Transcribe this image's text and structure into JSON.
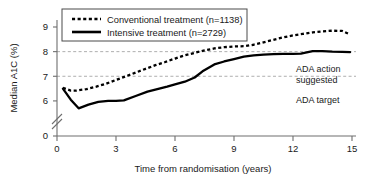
{
  "chart_data": {
    "type": "line",
    "title": "",
    "xlabel": "Time from randomisation (years)",
    "ylabel": "Median A1C (%)",
    "xlim": [
      0,
      15
    ],
    "ylim": [
      5.4,
      9.1
    ],
    "xticks": [
      "0",
      "3",
      "6",
      "9",
      "12",
      "15"
    ],
    "xtick_values": [
      0,
      3,
      6,
      9,
      12,
      15
    ],
    "yticks": [
      "0",
      "6",
      "7",
      "8",
      "9"
    ],
    "ytick_values": [
      0,
      6,
      7,
      8,
      9
    ],
    "y_axis_break": true,
    "grid": false,
    "legend_position": "top-center",
    "series": [
      {
        "name": "Conventional treatment (n=1138)",
        "style": "dotted",
        "color": "#000000",
        "x": [
          0.3,
          0.7,
          1.0,
          1.5,
          2.0,
          2.5,
          3.0,
          3.5,
          4.0,
          4.5,
          5.0,
          5.5,
          6.0,
          6.5,
          7.0,
          7.5,
          8.0,
          8.5,
          9.0,
          9.5,
          10.0,
          10.5,
          11.0,
          11.5,
          12.0,
          12.5,
          13.0,
          13.5,
          14.0,
          14.5,
          14.9
        ],
        "values": [
          6.53,
          6.42,
          6.42,
          6.48,
          6.58,
          6.7,
          6.85,
          7.0,
          7.15,
          7.3,
          7.45,
          7.58,
          7.72,
          7.85,
          7.95,
          8.05,
          8.13,
          8.18,
          8.21,
          8.22,
          8.28,
          8.38,
          8.48,
          8.58,
          8.66,
          8.72,
          8.78,
          8.82,
          8.85,
          8.84,
          8.7
        ]
      },
      {
        "name": "Intensive treatment (n=2729)",
        "style": "solid",
        "color": "#000000",
        "x": [
          0.3,
          0.7,
          1.1,
          1.6,
          2.1,
          2.6,
          3.0,
          3.4,
          4.0,
          4.6,
          5.1,
          5.6,
          6.0,
          6.5,
          7.0,
          7.4,
          8.0,
          8.5,
          9.0,
          9.5,
          10.0,
          10.5,
          11.0,
          11.5,
          12.0,
          12.4,
          13.0,
          13.5,
          14.0,
          14.5,
          14.9
        ],
        "values": [
          6.5,
          6.05,
          5.7,
          5.85,
          5.96,
          6.0,
          6.0,
          6.02,
          6.2,
          6.38,
          6.48,
          6.58,
          6.67,
          6.78,
          6.95,
          7.2,
          7.48,
          7.6,
          7.7,
          7.8,
          7.85,
          7.88,
          7.9,
          7.91,
          7.91,
          7.92,
          8.02,
          8.02,
          8.0,
          7.99,
          7.98
        ]
      }
    ],
    "reference_lines": [
      {
        "name": "ada-action-suggested",
        "value": 8,
        "label": "ADA action suggested",
        "label_line_1": "ADA action",
        "label_line_2": "suggested",
        "style": "dashed"
      },
      {
        "name": "ada-target",
        "value": 7,
        "label": "ADA target",
        "style": "dashed"
      }
    ]
  },
  "legend": {
    "entries": [
      {
        "label": "Conventional treatment (n=1138)",
        "style": "dotted"
      },
      {
        "label": "Intensive treatment (n=2729)",
        "style": "solid"
      }
    ]
  }
}
